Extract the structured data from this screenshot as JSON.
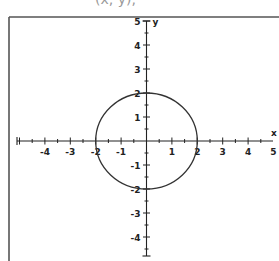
{
  "header": {
    "partial_text": "(x, y),"
  },
  "chart_data": {
    "type": "line",
    "title": "",
    "xlabel": "x",
    "ylabel": "y",
    "xlim": [
      -5,
      5
    ],
    "ylim": [
      -5,
      5
    ],
    "grid": false,
    "x_ticks": [
      -4,
      -3,
      -2,
      -1,
      1,
      2,
      3,
      4,
      5
    ],
    "y_ticks": [
      5,
      4,
      3,
      2,
      1,
      -1,
      -2,
      -3,
      -4
    ],
    "minor_tick_step": 0.5,
    "series": [
      {
        "name": "circle x^2 + y^2 = 4",
        "shape": "circle",
        "center": [
          0,
          0
        ],
        "radius": 2
      }
    ]
  },
  "layout": {
    "origin_px": [
      146.5,
      141
    ],
    "unit_x_px": 25.4,
    "unit_y_px": 24,
    "frame": {
      "left": 9,
      "top": 17
    },
    "x_axis_px": [
      17,
      273
    ],
    "y_axis_px": [
      21,
      256
    ]
  },
  "colors": {
    "axis": "#222222",
    "curve": "#333333",
    "frame": "#555555"
  }
}
